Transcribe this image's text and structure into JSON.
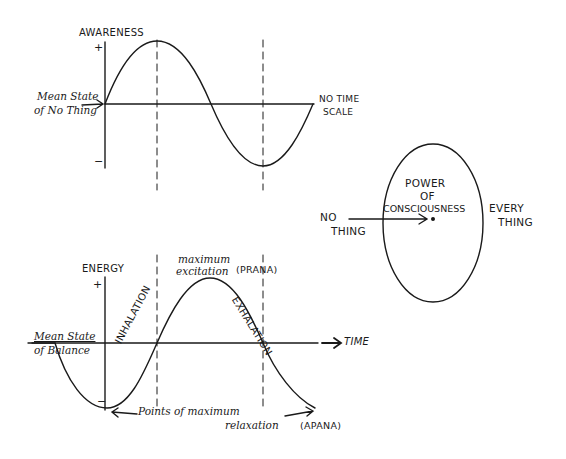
{
  "awareness_chart": {
    "y_label": "AWARENESS",
    "plus_sign": "+",
    "minus_sign": "−",
    "mean_label_line1": "Mean State",
    "mean_label_line2": "of No Thing",
    "x_label_line1": "NO TIME",
    "x_label_line2": "SCALE"
  },
  "consciousness_diagram": {
    "center_line1": "POWER",
    "center_line2": "OF",
    "center_line3": "CONSCIOUSNESS",
    "left_line1": "NO",
    "left_line2": "THING",
    "right_line1": "EVERY",
    "right_line2": "THING"
  },
  "energy_chart": {
    "y_label": "ENERGY",
    "plus_sign": "+",
    "minus_sign": "−",
    "mean_label_line1": "Mean State",
    "mean_label_line2": "of Balance",
    "x_label": "TIME",
    "peak_label_line1": "maximum",
    "peak_label_line2": "excitation",
    "peak_term": "(PRANA)",
    "rising_label": "INHALATION",
    "falling_label": "EXHALATION",
    "trough_label_line1": "Points of maximum",
    "trough_label_line2": "relaxation",
    "trough_term": "(APANA)"
  },
  "colors": {
    "ink": "#1a1a1a",
    "paper": "#ffffff"
  }
}
